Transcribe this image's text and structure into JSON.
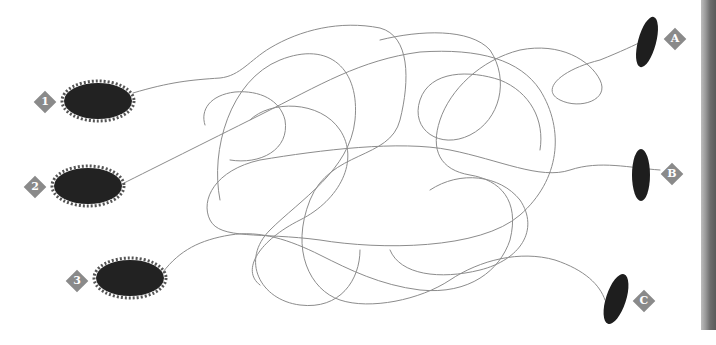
{
  "puzzle": {
    "type": "tangled-lines-matching",
    "left_items": [
      {
        "label": "1",
        "name": "caterpillar-1"
      },
      {
        "label": "2",
        "name": "caterpillar-2"
      },
      {
        "label": "3",
        "name": "caterpillar-3"
      }
    ],
    "right_items": [
      {
        "label": "A",
        "name": "cocoon-a"
      },
      {
        "label": "B",
        "name": "cocoon-b"
      },
      {
        "label": "C",
        "name": "cocoon-c"
      }
    ],
    "colors": {
      "line": "#8c8c8c",
      "label_badge": "#8a8a8a",
      "body": "#1e1e1e"
    }
  }
}
